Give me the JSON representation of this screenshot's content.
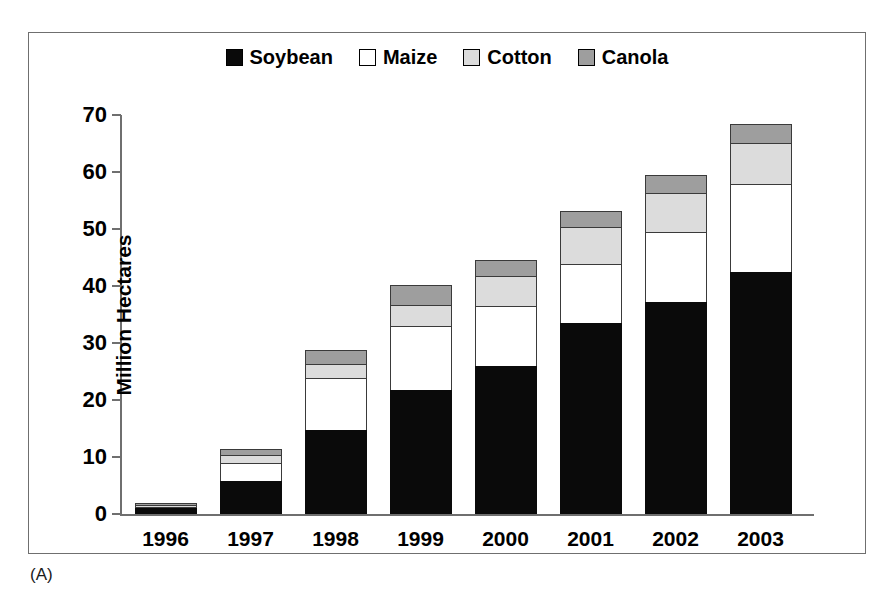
{
  "figure": {
    "panel_caption": "(A)",
    "scan_bleed_text": ""
  },
  "legend": {
    "position": "top-center",
    "entries": [
      {
        "label": "Soybean",
        "color": "#0a0a0a",
        "swatch": "filled-black-swatch"
      },
      {
        "label": "Maize",
        "color": "#ffffff",
        "swatch": "empty-white-swatch"
      },
      {
        "label": "Cotton",
        "color": "#dcdcdc",
        "swatch": "light-gray-swatch"
      },
      {
        "label": "Canola",
        "color": "#9e9e9e",
        "swatch": "medium-gray-swatch"
      }
    ]
  },
  "axes": {
    "y_title": "Million Hectares",
    "y_ticks": [
      "70",
      "60",
      "50",
      "40",
      "30",
      "20",
      "10",
      "0"
    ],
    "x_ticks": [
      "1996",
      "1997",
      "1998",
      "1999",
      "2000",
      "2001",
      "2002",
      "2003"
    ]
  },
  "chart_data": {
    "type": "bar",
    "subtype": "stacked-vertical",
    "title": "",
    "subtitle": "",
    "xlabel": "",
    "ylabel": "Million Hectares",
    "ylim": [
      0,
      70
    ],
    "ytick_step": 10,
    "grid": false,
    "legend_position": "top-center",
    "categories": [
      "1996",
      "1997",
      "1998",
      "1999",
      "2000",
      "2001",
      "2002",
      "2003"
    ],
    "series": [
      {
        "name": "Soybean",
        "color": "#0a0a0a",
        "values": [
          1.0,
          5.8,
          14.8,
          21.8,
          26.0,
          33.5,
          37.2,
          42.5
        ]
      },
      {
        "name": "Maize",
        "color": "#ffffff",
        "values": [
          0.3,
          3.2,
          9.0,
          11.2,
          10.5,
          10.3,
          12.3,
          15.4
        ]
      },
      {
        "name": "Cotton",
        "color": "#dcdcdc",
        "values": [
          0.3,
          1.4,
          2.5,
          3.7,
          5.3,
          6.5,
          6.8,
          7.2
        ]
      },
      {
        "name": "Canola",
        "color": "#9e9e9e",
        "values": [
          0.1,
          1.0,
          2.4,
          3.5,
          2.8,
          2.8,
          3.1,
          3.3
        ]
      }
    ],
    "totals": [
      1.7,
      11.4,
      28.7,
      40.2,
      44.6,
      53.1,
      59.4,
      68.4
    ]
  }
}
